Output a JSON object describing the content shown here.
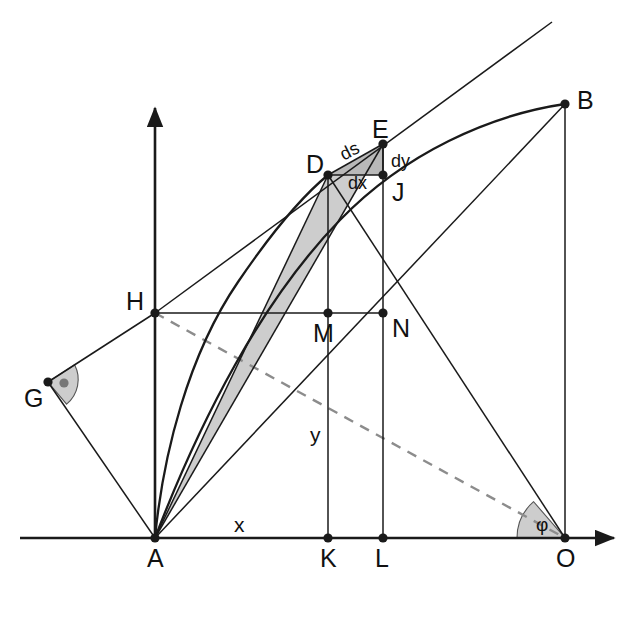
{
  "figure": {
    "background_color": "#ffffff",
    "stroke_color": "#1a1a1a",
    "dashed_color": "#8c8c8c",
    "shade_light": "#cdcdcd",
    "shade_mid": "#b9b9b9",
    "width": 643,
    "height": 625
  },
  "axes": {
    "x_axis": {
      "from": [
        20,
        538
      ],
      "to": [
        622,
        538
      ],
      "arrow": true
    },
    "y_axis": {
      "from": [
        155,
        538
      ],
      "to": [
        155,
        100
      ],
      "arrow": true
    },
    "origin_label": "A"
  },
  "points": [
    {
      "name": "A",
      "label": "A",
      "x": 155,
      "y": 538,
      "lx": 147,
      "ly": 546,
      "dot": true
    },
    {
      "name": "B",
      "label": "B",
      "x": 565,
      "y": 104,
      "lx": 577,
      "ly": 88,
      "dot": true
    },
    {
      "name": "D",
      "label": "D",
      "x": 328,
      "y": 175,
      "lx": 306,
      "ly": 152,
      "dot": true
    },
    {
      "name": "E",
      "label": "E",
      "x": 383,
      "y": 144,
      "lx": 372,
      "ly": 117,
      "dot": true
    },
    {
      "name": "G",
      "label": "G",
      "x": 48,
      "y": 382,
      "lx": 24,
      "ly": 386,
      "dot": true
    },
    {
      "name": "H",
      "label": "H",
      "x": 155,
      "y": 313,
      "lx": 126,
      "ly": 289,
      "dot": true
    },
    {
      "name": "J",
      "label": "J",
      "x": 383,
      "y": 175,
      "lx": 392,
      "ly": 180,
      "dot": true
    },
    {
      "name": "K",
      "label": "K",
      "x": 328,
      "y": 538,
      "lx": 320,
      "ly": 546,
      "dot": true
    },
    {
      "name": "L",
      "label": "L",
      "x": 383,
      "y": 538,
      "lx": 375,
      "ly": 546,
      "dot": true
    },
    {
      "name": "M",
      "label": "M",
      "x": 328,
      "y": 313,
      "lx": 313,
      "ly": 321,
      "dot": true
    },
    {
      "name": "N",
      "label": "N",
      "x": 383,
      "y": 313,
      "lx": 392,
      "ly": 316,
      "dot": true
    },
    {
      "name": "O",
      "label": "O",
      "x": 565,
      "y": 538,
      "lx": 556,
      "ly": 546,
      "dot": true
    }
  ],
  "labels": {
    "x_segment": {
      "text": "x",
      "lx": 234,
      "ly": 514
    },
    "y_segment": {
      "text": "y",
      "lx": 310,
      "ly": 424
    },
    "ds": {
      "text": "ds",
      "lx": 340,
      "ly": 142
    },
    "dx": {
      "text": "dx",
      "lx": 348,
      "ly": 174
    },
    "dy": {
      "text": "dy",
      "lx": 391,
      "ly": 152
    },
    "phi": {
      "text": "φ",
      "lx": 536,
      "ly": 515
    }
  },
  "segments": [
    {
      "name": "A-B",
      "from": [
        155,
        538
      ],
      "to": [
        565,
        104
      ]
    },
    {
      "name": "A-D",
      "from": [
        155,
        538
      ],
      "to": [
        328,
        175
      ]
    },
    {
      "name": "A-E",
      "from": [
        155,
        538
      ],
      "to": [
        383,
        144
      ]
    },
    {
      "name": "A-H",
      "from": [
        155,
        538
      ],
      "to": [
        155,
        313
      ]
    },
    {
      "name": "A-G",
      "from": [
        155,
        538
      ],
      "to": [
        48,
        382
      ]
    },
    {
      "name": "G-H",
      "from": [
        48,
        382
      ],
      "to": [
        155,
        313
      ]
    },
    {
      "name": "H-D",
      "from": [
        155,
        313
      ],
      "to": [
        328,
        175
      ]
    },
    {
      "name": "H-E-ext",
      "from": [
        155,
        313
      ],
      "to": [
        552,
        22
      ]
    },
    {
      "name": "H-N",
      "from": [
        155,
        313
      ],
      "to": [
        383,
        313
      ]
    },
    {
      "name": "D-E",
      "from": [
        328,
        175
      ],
      "to": [
        383,
        144
      ]
    },
    {
      "name": "D-J",
      "from": [
        328,
        175
      ],
      "to": [
        383,
        175
      ]
    },
    {
      "name": "E-J",
      "from": [
        383,
        144
      ],
      "to": [
        383,
        175
      ]
    },
    {
      "name": "D-K",
      "from": [
        328,
        175
      ],
      "to": [
        328,
        538
      ]
    },
    {
      "name": "E-L",
      "from": [
        383,
        144
      ],
      "to": [
        383,
        538
      ]
    },
    {
      "name": "D-O",
      "from": [
        328,
        175
      ],
      "to": [
        565,
        538
      ]
    },
    {
      "name": "A-O-diag",
      "from": [
        155,
        538
      ],
      "to": [
        565,
        104
      ]
    },
    {
      "name": "B-O",
      "from": [
        565,
        104
      ],
      "to": [
        565,
        538
      ]
    },
    {
      "name": "A-L-ray",
      "from": [
        155,
        538
      ],
      "to": [
        383,
        144
      ]
    }
  ],
  "dashed_segments": [
    {
      "name": "H-O-dashed",
      "from": [
        155,
        313
      ],
      "to": [
        565,
        538
      ]
    }
  ],
  "curves": [
    {
      "name": "brachistochrone-A-B",
      "type": "cycloid",
      "from": [
        155,
        538
      ],
      "to": [
        565,
        104
      ]
    },
    {
      "name": "arc-A-D",
      "type": "arc",
      "from": [
        155,
        538
      ],
      "to": [
        328,
        175
      ]
    }
  ],
  "shaded_regions": [
    {
      "name": "triangle-A-D-E",
      "fill": "#cdcdcd",
      "points": "155,538 328,175 383,144"
    },
    {
      "name": "triangle-D-E-J",
      "fill": "#b9b9b9",
      "points": "328,175 383,144 383,175"
    }
  ],
  "angle_markers": [
    {
      "name": "right-angle-at-G",
      "vertex": [
        48,
        382
      ],
      "type": "right-angle-dot",
      "fill": "#cdcdcd"
    },
    {
      "name": "angle-phi-at-O",
      "vertex": [
        565,
        538
      ],
      "type": "wedge",
      "label": "φ",
      "fill": "#cdcdcd"
    }
  ]
}
